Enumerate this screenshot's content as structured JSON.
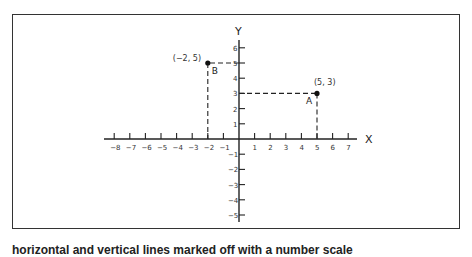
{
  "diagram": {
    "axes": {
      "x_label": "X",
      "y_label": "Y",
      "x_ticks": [
        -8,
        -7,
        -6,
        -5,
        -4,
        -3,
        -2,
        -1,
        1,
        2,
        3,
        4,
        5,
        6,
        7
      ],
      "y_ticks": [
        6,
        5,
        4,
        3,
        2,
        1,
        -1,
        -2,
        -3,
        -4,
        -5
      ],
      "x_tick_labels": [
        "−8",
        "−7",
        "−6",
        "−5",
        "−4",
        "−3",
        "−2",
        "−1",
        "1",
        "2",
        "3",
        "4",
        "5",
        "6",
        "7"
      ],
      "y_tick_labels": [
        "6",
        "5",
        "4",
        "3",
        "2",
        "1",
        "−1",
        "−2",
        "−3",
        "−4",
        "−5"
      ]
    },
    "points": [
      {
        "name": "A",
        "coord_label": "(5, 3)",
        "x": 5,
        "y": 3
      },
      {
        "name": "B",
        "coord_label": "(−2, 5)",
        "x": -2,
        "y": 5
      }
    ]
  },
  "caption": "horizontal and vertical lines marked off with a number scale"
}
